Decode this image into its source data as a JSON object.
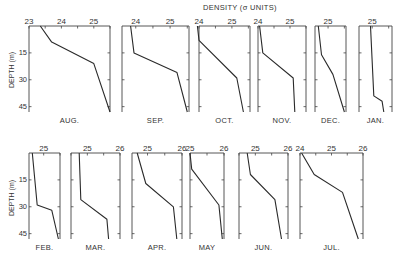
{
  "chart_data": {
    "type": "line",
    "title": "DENSITY (σ UNITS)",
    "xlabel": "DENSITY (σ UNITS)",
    "ylabel": "DEPTH (m)",
    "y_ticks": [
      15,
      30,
      45
    ],
    "ylim": [
      0,
      48
    ],
    "y_inverted": true,
    "grid": false,
    "panels": [
      {
        "month": "AUG.",
        "xlim": [
          23.0,
          25.5
        ],
        "x_ticks": [
          23,
          24,
          25
        ],
        "tick_labels": [
          "23",
          "24",
          "25"
        ],
        "depth": [
          0,
          9,
          21,
          48
        ],
        "density": [
          23.35,
          23.7,
          25.0,
          25.5
        ]
      },
      {
        "month": "SEP.",
        "xlim": [
          23.6,
          25.55
        ],
        "x_ticks": [
          24,
          25
        ],
        "tick_labels": [
          "24",
          "25"
        ],
        "depth": [
          0,
          15,
          26,
          48
        ],
        "density": [
          23.85,
          23.95,
          25.2,
          25.5
        ]
      },
      {
        "month": "OCT.",
        "xlim": [
          24.0,
          25.55
        ],
        "x_ticks": [
          24,
          25
        ],
        "tick_labels": [
          "24",
          "25"
        ],
        "depth": [
          0,
          8,
          29,
          48
        ],
        "density": [
          23.95,
          24.0,
          25.15,
          25.35
        ]
      },
      {
        "month": "NOV.",
        "xlim": [
          24.0,
          25.5
        ],
        "x_ticks": [
          24,
          25
        ],
        "tick_labels": [
          "24",
          "25"
        ],
        "depth": [
          0,
          15,
          29,
          48
        ],
        "density": [
          24.05,
          24.15,
          25.1,
          25.15
        ]
      },
      {
        "month": "DEC.",
        "xlim": [
          24.6,
          25.55
        ],
        "x_ticks": [
          25
        ],
        "tick_labels": [
          "25"
        ],
        "depth": [
          0,
          16,
          27,
          48
        ],
        "density": [
          24.7,
          24.8,
          25.15,
          25.5
        ]
      },
      {
        "month": "JAN.",
        "xlim": [
          24.6,
          25.6
        ],
        "x_ticks": [
          25
        ],
        "tick_labels": [
          "25"
        ],
        "depth": [
          0,
          39,
          42,
          48
        ],
        "density": [
          24.95,
          25.05,
          25.3,
          25.35
        ]
      },
      {
        "month": "FEB.",
        "xlim": [
          24.55,
          25.5
        ],
        "x_ticks": [
          25
        ],
        "tick_labels": [
          "25"
        ],
        "depth": [
          0,
          29,
          32,
          48
        ],
        "density": [
          24.65,
          24.8,
          25.25,
          25.45
        ]
      },
      {
        "month": "MAR.",
        "xlim": [
          24.5,
          26.0
        ],
        "x_ticks": [
          25,
          26
        ],
        "tick_labels": [
          "25",
          "26"
        ],
        "depth": [
          0,
          26,
          37,
          48
        ],
        "density": [
          24.75,
          24.8,
          25.6,
          25.65
        ]
      },
      {
        "month": "APR.",
        "xlim": [
          24.55,
          26.0
        ],
        "x_ticks": [
          25,
          26
        ],
        "tick_labels": [
          "25",
          "26"
        ],
        "depth": [
          0,
          17,
          30,
          48
        ],
        "density": [
          24.7,
          24.95,
          25.75,
          25.85
        ]
      },
      {
        "month": "MAY",
        "xlim": [
          25.0,
          26.0
        ],
        "x_ticks": [
          25,
          26
        ],
        "tick_labels": [
          "25",
          "26"
        ],
        "depth": [
          0,
          9,
          29,
          48
        ],
        "density": [
          25.0,
          25.05,
          25.85,
          25.95
        ]
      },
      {
        "month": "JUN.",
        "xlim": [
          24.5,
          26.0
        ],
        "x_ticks": [
          25,
          26
        ],
        "tick_labels": [
          "25",
          "26"
        ],
        "depth": [
          0,
          12,
          26,
          48
        ],
        "density": [
          24.75,
          24.85,
          25.6,
          25.8
        ]
      },
      {
        "month": "JUL.",
        "xlim": [
          24.0,
          26.0
        ],
        "x_ticks": [
          24,
          25,
          26
        ],
        "tick_labels": [
          "24",
          "25",
          "26"
        ],
        "depth": [
          0,
          12,
          22,
          48
        ],
        "density": [
          24.05,
          24.45,
          25.35,
          25.85
        ]
      }
    ]
  },
  "layout": {
    "rows": [
      {
        "top": 26,
        "bottom": 112,
        "depth_label_y": 70
      },
      {
        "top": 153,
        "bottom": 239,
        "depth_label_y": 198
      }
    ],
    "panel_px": [
      {
        "row": 0,
        "left": 29,
        "right": 110
      },
      {
        "row": 0,
        "left": 122,
        "right": 189
      },
      {
        "row": 0,
        "left": 199,
        "right": 250
      },
      {
        "row": 0,
        "left": 258,
        "right": 306
      },
      {
        "row": 0,
        "left": 315,
        "right": 346
      },
      {
        "row": 0,
        "left": 359,
        "right": 392
      },
      {
        "row": 1,
        "left": 29,
        "right": 60
      },
      {
        "row": 1,
        "left": 71,
        "right": 120
      },
      {
        "row": 1,
        "left": 132,
        "right": 182
      },
      {
        "row": 1,
        "left": 190,
        "right": 224
      },
      {
        "row": 1,
        "left": 239,
        "right": 288
      },
      {
        "row": 1,
        "left": 300,
        "right": 363
      }
    ],
    "line_color": "#2a2a2a",
    "axis_color": "#444444"
  }
}
